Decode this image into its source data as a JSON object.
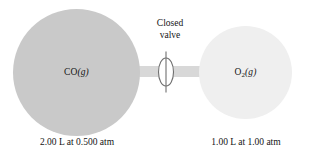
{
  "figure": {
    "background_color": "#ffffff"
  },
  "tube": {
    "name": "connecting-tube",
    "color": "#d8d8d8"
  },
  "valve": {
    "caption_line1": "Closed",
    "caption_line2": "valve",
    "fill_color": "#ffffff",
    "stroke_color": "#6f6f6f",
    "state": "closed"
  },
  "vessels": [
    {
      "id": "left",
      "gas_formula": "CO",
      "gas_subscript": "",
      "phase": "(g)",
      "label_plain": "CO(g)",
      "fill_color": "#c9c9c9",
      "volume": "2.00 L",
      "pressure": "0.500 atm",
      "caption": "2.00 L at 0.500 atm"
    },
    {
      "id": "right",
      "gas_formula": "O",
      "gas_subscript": "2",
      "phase": "(g)",
      "label_plain": "O2(g)",
      "fill_color": "#efefef",
      "volume": "1.00 L",
      "pressure": "1.00 atm",
      "caption": "1.00 L at 1.00 atm"
    }
  ]
}
